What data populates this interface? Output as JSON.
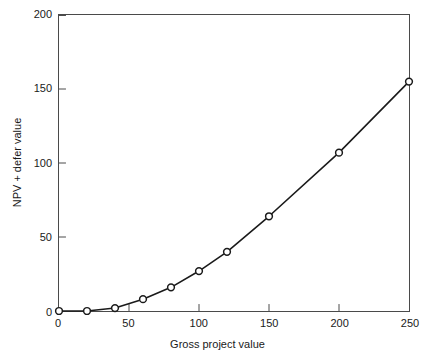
{
  "chart_data": {
    "type": "line",
    "title": "",
    "subtitle": "",
    "xlabel": "Gross project value",
    "ylabel": "NPV + defer value",
    "xlim": [
      0,
      250
    ],
    "ylim": [
      0,
      200
    ],
    "xticks": [
      0,
      50,
      100,
      150,
      200,
      250
    ],
    "yticks": [
      0,
      50,
      100,
      150,
      200
    ],
    "xtick_labels": [
      "0",
      "50",
      "100",
      "150",
      "200",
      "250"
    ],
    "ytick_labels": [
      "0",
      "50",
      "100",
      "150",
      "200"
    ],
    "grid": false,
    "legend": null,
    "legend_position": "none",
    "marker": "open-circle",
    "line_color": "#1a1a1a",
    "marker_face_color": "#ffffff",
    "marker_edge_color": "#1a1a1a",
    "x": [
      0,
      20,
      40,
      60,
      80,
      100,
      120,
      150,
      200,
      250
    ],
    "values": [
      0,
      0,
      2,
      8,
      16,
      27,
      40,
      64,
      107,
      155
    ],
    "series": [
      {
        "name": "NPV + defer value",
        "x": [
          0,
          20,
          40,
          60,
          80,
          100,
          120,
          150,
          200,
          250
        ],
        "values": [
          0,
          0,
          2,
          8,
          16,
          27,
          40,
          64,
          107,
          155
        ]
      }
    ],
    "annotations": []
  },
  "axes": {
    "frame_color": "#4a4a4a",
    "tick_color": "#1a1a1a"
  }
}
